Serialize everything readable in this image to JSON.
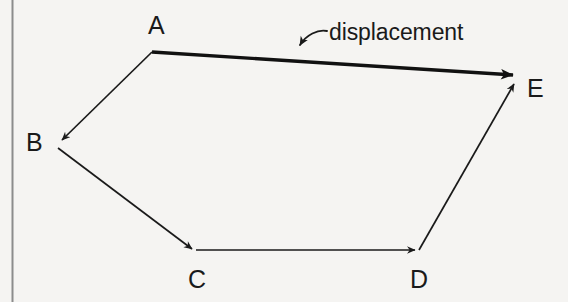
{
  "diagram": {
    "background_color": "#f5f4f2",
    "ink_color": "#1a1a1a",
    "border": {
      "name": "page-margin-rule",
      "orientation": "vertical",
      "x": 12,
      "y_start": 0,
      "y_end": 302,
      "color": "#8c8c8c",
      "width": 2
    },
    "points": [
      {
        "id": "A",
        "label": "A",
        "x": 152,
        "y": 52
      },
      {
        "id": "B",
        "label": "B",
        "x": 58,
        "y": 144
      },
      {
        "id": "C",
        "label": "C",
        "x": 196,
        "y": 250
      },
      {
        "id": "D",
        "label": "D",
        "x": 419,
        "y": 250
      },
      {
        "id": "E",
        "label": "E",
        "x": 518,
        "y": 78
      }
    ],
    "path_segments": [
      {
        "id": "AB",
        "from": "A",
        "to": "B",
        "x1": 152,
        "y1": 52,
        "x2": 62,
        "y2": 140,
        "style": "thin",
        "stroke_width": 1.7,
        "arrowhead": true
      },
      {
        "id": "BC",
        "from": "B",
        "to": "C",
        "x1": 58,
        "y1": 148,
        "x2": 192,
        "y2": 249,
        "style": "thin",
        "stroke_width": 1.7,
        "arrowhead": true
      },
      {
        "id": "CD",
        "from": "C",
        "to": "D",
        "x1": 196,
        "y1": 250,
        "x2": 415,
        "y2": 250,
        "style": "thin",
        "stroke_width": 1.7,
        "arrowhead": true
      },
      {
        "id": "DE",
        "from": "D",
        "to": "E",
        "x1": 419,
        "y1": 250,
        "x2": 514,
        "y2": 84,
        "style": "thin",
        "stroke_width": 1.7,
        "arrowhead": true
      }
    ],
    "resultant": {
      "id": "AE",
      "from": "A",
      "to": "E",
      "label": "displacement",
      "x1": 152,
      "y1": 52,
      "x2": 515,
      "y2": 76,
      "style": "thick",
      "stroke_width": 3.4,
      "arrowhead": true
    },
    "leader": {
      "name": "displacement-leader-arrow",
      "from_x": 327,
      "from_y": 33,
      "to_x": 296,
      "to_y": 49,
      "curved": true,
      "arrowhead": true,
      "stroke_width": 1.8
    },
    "labels": {
      "A": "A",
      "B": "B",
      "C": "C",
      "D": "D",
      "E": "E",
      "displacement": "displacement"
    }
  }
}
